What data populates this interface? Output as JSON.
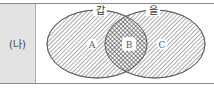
{
  "row_label": "(나)",
  "diagram": {
    "type": "venn",
    "sets": [
      {
        "name": "갑",
        "color": "#444444"
      },
      {
        "name": "을",
        "color": "#444444"
      }
    ],
    "regions": [
      {
        "label": "A",
        "membership": "갑 only",
        "pattern": "diagonal-hatch"
      },
      {
        "label": "B",
        "membership": "갑 ∩ 을",
        "pattern": "cross-hatch"
      },
      {
        "label": "C",
        "membership": "을 only",
        "pattern": "diagonal-hatch"
      }
    ]
  },
  "colors": {
    "label_cell_bg": "#e3e3e3",
    "border": "#8a8a8a",
    "hatch": "#444444"
  }
}
